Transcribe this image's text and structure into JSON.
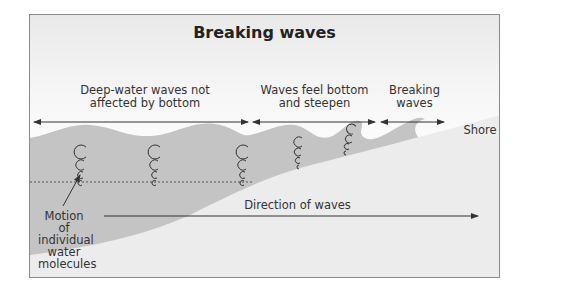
{
  "title": "Breaking waves",
  "zones": [
    {
      "label_line1": "Deep-water waves not",
      "label_line2": "affected by bottom"
    },
    {
      "label_line1": "Waves feel bottom",
      "label_line2": "and steepen"
    },
    {
      "label_line1": "Breaking",
      "label_line2": "waves"
    }
  ],
  "shore_label": "Shore",
  "molecule_label": {
    "line1": "Motion of",
    "line2": "individual",
    "line3": "water",
    "line4": "molecules"
  },
  "direction_label": "Direction of waves",
  "colors": {
    "water": "#c4c4c4",
    "seabed": "#ececec",
    "frame": "#8a8a8a",
    "text": "#333333"
  }
}
